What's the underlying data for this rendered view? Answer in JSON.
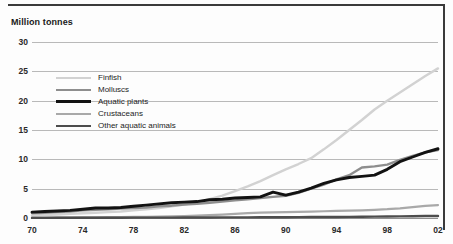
{
  "chart_data": {
    "type": "line",
    "title": "",
    "ylabel": "Million tonnes",
    "xlabel": "",
    "ylim": [
      0,
      30
    ],
    "xlim": [
      1970,
      2002
    ],
    "grid": true,
    "legend_position": "inside-upper-left",
    "yticks": [
      "0",
      "5",
      "10",
      "15",
      "20",
      "25",
      "30"
    ],
    "ytick_values": [
      0,
      5,
      10,
      15,
      20,
      25,
      30
    ],
    "xticks": [
      "70",
      "74",
      "78",
      "82",
      "86",
      "90",
      "94",
      "98",
      "02"
    ],
    "xtick_values": [
      1970,
      1974,
      1978,
      1982,
      1986,
      1990,
      1994,
      1998,
      2002
    ],
    "x": [
      1970,
      1971,
      1972,
      1973,
      1974,
      1975,
      1976,
      1977,
      1978,
      1979,
      1980,
      1981,
      1982,
      1983,
      1984,
      1985,
      1986,
      1987,
      1988,
      1989,
      1990,
      1991,
      1992,
      1993,
      1994,
      1995,
      1996,
      1997,
      1998,
      1999,
      2000,
      2001,
      2002
    ],
    "series": [
      {
        "name": "Finfish",
        "color": "#d2d2d2",
        "width": 2.4,
        "values": [
          0.4,
          0.5,
          0.6,
          0.7,
          0.8,
          0.9,
          1.0,
          1.1,
          1.3,
          1.5,
          1.7,
          2.0,
          2.3,
          2.7,
          3.2,
          3.8,
          4.6,
          5.4,
          6.3,
          7.3,
          8.3,
          9.2,
          10.2,
          11.7,
          13.3,
          15.0,
          16.7,
          18.5,
          20.0,
          21.4,
          22.8,
          24.2,
          25.5
        ]
      },
      {
        "name": "Molluscs",
        "color": "#8e8e8e",
        "width": 2.4,
        "values": [
          0.8,
          0.9,
          1.0,
          1.1,
          1.3,
          1.4,
          1.5,
          1.6,
          1.7,
          1.8,
          2.0,
          2.1,
          2.3,
          2.4,
          2.6,
          2.8,
          3.0,
          3.2,
          3.4,
          3.6,
          3.8,
          4.3,
          5.0,
          5.7,
          6.6,
          7.3,
          8.6,
          8.8,
          9.1,
          9.9,
          10.6,
          11.2,
          11.6
        ]
      },
      {
        "name": "Aquatic plants",
        "color": "#121212",
        "width": 2.9,
        "values": [
          1.0,
          1.1,
          1.2,
          1.3,
          1.5,
          1.7,
          1.7,
          1.8,
          2.0,
          2.2,
          2.4,
          2.6,
          2.7,
          2.8,
          3.1,
          3.2,
          3.4,
          3.5,
          3.6,
          4.4,
          3.9,
          4.4,
          5.1,
          5.9,
          6.5,
          6.9,
          7.1,
          7.3,
          8.3,
          9.6,
          10.4,
          11.2,
          11.8
        ]
      },
      {
        "name": "Crustaceans",
        "color": "#a9a9a9",
        "width": 2.2,
        "values": [
          0.05,
          0.06,
          0.07,
          0.08,
          0.1,
          0.12,
          0.14,
          0.16,
          0.18,
          0.2,
          0.24,
          0.28,
          0.33,
          0.4,
          0.48,
          0.58,
          0.7,
          0.82,
          0.9,
          0.95,
          1.0,
          1.05,
          1.1,
          1.15,
          1.2,
          1.25,
          1.3,
          1.4,
          1.5,
          1.65,
          1.85,
          2.05,
          2.2
        ]
      },
      {
        "name": "Other aquatic animals",
        "color": "#4d4d4d",
        "width": 2.4,
        "values": [
          0.02,
          0.02,
          0.03,
          0.03,
          0.04,
          0.04,
          0.05,
          0.05,
          0.06,
          0.06,
          0.07,
          0.07,
          0.08,
          0.08,
          0.09,
          0.1,
          0.1,
          0.11,
          0.12,
          0.13,
          0.14,
          0.15,
          0.16,
          0.17,
          0.18,
          0.2,
          0.22,
          0.24,
          0.26,
          0.28,
          0.3,
          0.33,
          0.35
        ]
      }
    ]
  }
}
